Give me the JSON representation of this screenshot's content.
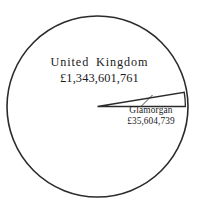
{
  "chart_data": {
    "type": "pie",
    "title": "",
    "subtitle": "",
    "xlabel": "",
    "ylabel": "",
    "legend_position": "none",
    "grid": false,
    "labels_inline": true,
    "currency_symbol": "£",
    "categories": [
      "United Kingdom",
      "Glamorgan"
    ],
    "values": [
      1343601761,
      35604739
    ],
    "value_labels": [
      "£1,343,601,761",
      "£35,604,739"
    ],
    "series": [
      {
        "name": "Rateable value",
        "values": [
          1343601761,
          35604739
        ]
      }
    ],
    "slices": [
      {
        "name": "United Kingdom",
        "value": 1343601761,
        "value_label": "£1,343,601,761",
        "share_percent": 97.42,
        "color": "#ffffff",
        "outline_color": "#2b2b2b"
      },
      {
        "name": "Glamorgan",
        "value": 35604739,
        "value_label": "£35,604,739",
        "share_percent": 2.58,
        "color": "#ffffff",
        "outline_color": "#2b2b2b"
      }
    ]
  },
  "figure": {
    "background_color": "#ffffff",
    "ink_color": "#2b2b2b",
    "circle": {
      "cx": 97.5,
      "cy": 106.5,
      "r": 90.5
    }
  },
  "labels": {
    "major": {
      "name": "United  Kingdom",
      "value": "£1,343,601,761"
    },
    "minor": {
      "name": "Glamorgan",
      "value": "£35,604,739"
    }
  }
}
